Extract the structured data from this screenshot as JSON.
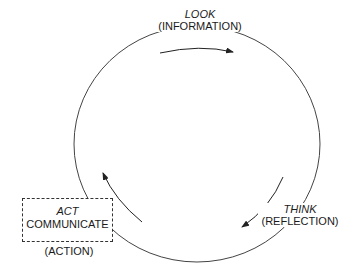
{
  "diagram": {
    "type": "cycle",
    "nodes": [
      {
        "id": "look",
        "title": "LOOK",
        "subtitle": "(INFORMATION)"
      },
      {
        "id": "think",
        "title": "THINK",
        "subtitle": "(REFLECTION)"
      },
      {
        "id": "act",
        "title": "ACT",
        "subtitle": "COMMUNICATE",
        "caption": "(ACTION)"
      }
    ],
    "edges": [
      {
        "from": "act",
        "to": "look",
        "direction": "clockwise"
      },
      {
        "from": "look",
        "to": "think",
        "direction": "clockwise"
      },
      {
        "from": "think",
        "to": "act",
        "direction": "clockwise"
      }
    ],
    "colors": {
      "stroke": "#333333",
      "background": "#ffffff"
    }
  }
}
